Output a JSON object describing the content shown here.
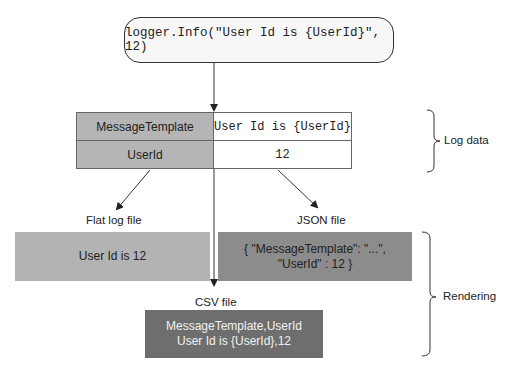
{
  "code": {
    "statement": "logger.Info(\"User Id is {UserId}\", 12)"
  },
  "log_data_table": {
    "rows": [
      {
        "key": "MessageTemplate",
        "value": "User Id is {UserId}"
      },
      {
        "key": "UserId",
        "value": "12"
      }
    ]
  },
  "braces": {
    "log_data": "Log data",
    "rendering": "Rendering"
  },
  "outputs": {
    "flat": {
      "label": "Flat log file",
      "content": "User Id is 12"
    },
    "json": {
      "label": "JSON file",
      "line1": "{ \"MessageTemplate\": \"...\",",
      "line2": "\"UserId\" : 12 }"
    },
    "csv": {
      "label": "CSV file",
      "line1": "MessageTemplate,UserId",
      "line2": "User Id is {UserId},12"
    }
  },
  "colors": {
    "key_cell": "#b5b5b5",
    "flat_box": "#b3b3b3",
    "json_box": "#8c8c8c",
    "csv_box": "#6e6e6e"
  }
}
